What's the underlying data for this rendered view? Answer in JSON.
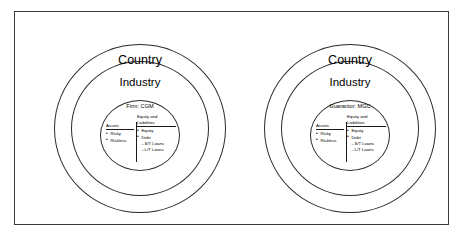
{
  "figure": {
    "border_color": "#3a3a3a",
    "line_color": "#2b2b2b",
    "background": "#ffffff"
  },
  "groups": [
    {
      "id": "left",
      "outer_label": "Country",
      "middle_label": "Industry",
      "inner_title": "Firm: CGM",
      "balance_sheet": {
        "assets_header": "Assets",
        "liabilities_header_line1": "Equity and",
        "liabilities_header_line2": "Liabilities",
        "assets_items": [
          "Risky",
          "Riskless"
        ],
        "liabilities_items": [
          "Equity",
          "Debt"
        ],
        "debt_subitems": [
          "S/T Loans",
          "L/T Loans"
        ]
      }
    },
    {
      "id": "right",
      "outer_label": "Country",
      "middle_label": "Industry",
      "inner_title": "Guarantor: MGC",
      "balance_sheet": {
        "assets_header": "Assets",
        "liabilities_header_line1": "Equity and",
        "liabilities_header_line2": "Liabilities",
        "assets_items": [
          "Risky",
          "Riskless"
        ],
        "liabilities_items": [
          "Equity",
          "Debt"
        ],
        "debt_subitems": [
          "S/T Loans",
          "L/T Loans"
        ]
      }
    }
  ]
}
